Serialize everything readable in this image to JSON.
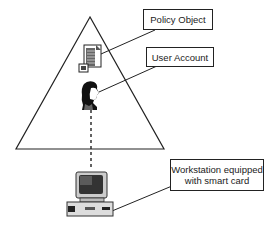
{
  "diagram": {
    "type": "hierarchy-triangle",
    "labels": {
      "policy_object": "Policy Object",
      "user_account": "User Account",
      "workstation_line1": "Workstation equipped",
      "workstation_line2": "with smart card"
    },
    "icons": {
      "policy": "document-icon",
      "user": "user-head-icon",
      "workstation": "computer-icon"
    },
    "colors": {
      "line": "#222222",
      "background": "#ffffff"
    }
  }
}
